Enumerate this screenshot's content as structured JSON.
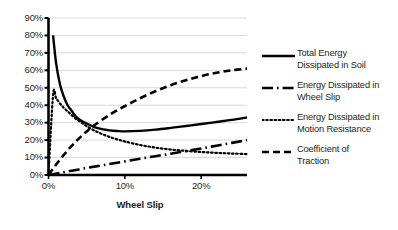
{
  "chart_data": {
    "type": "line",
    "title": "",
    "xlabel": "Wheel Slip",
    "ylabel": "",
    "xlim": [
      0,
      26
    ],
    "ylim": [
      0,
      90
    ],
    "grid": true,
    "legend_position": "right",
    "x_ticks": [
      "0%",
      "10%",
      "20%"
    ],
    "x_tick_values": [
      0,
      10,
      20
    ],
    "y_ticks": [
      "0%",
      "10%",
      "20%",
      "30%",
      "40%",
      "50%",
      "60%",
      "70%",
      "80%",
      "90%"
    ],
    "y_tick_values": [
      0,
      10,
      20,
      30,
      40,
      50,
      60,
      70,
      80,
      90
    ],
    "series": [
      {
        "name": "Total Energy Dissipated in Soil",
        "style": "solid",
        "x": [
          0.6,
          1.0,
          1.5,
          2.0,
          2.5,
          3.0,
          3.5,
          4.0,
          5.0,
          6.0,
          7.0,
          8.0,
          9.0,
          10.0,
          12.0,
          14.0,
          16.0,
          18.0,
          20.0,
          22.0,
          24.0,
          26.0
        ],
        "values": [
          80,
          64,
          52,
          45,
          40,
          37,
          34,
          32,
          29.5,
          27.5,
          26.3,
          25.6,
          25.2,
          25.0,
          25.3,
          26.0,
          27.0,
          28.1,
          29.2,
          30.4,
          31.6,
          33.0
        ]
      },
      {
        "name": "Energy Dissipated in Wheel Slip",
        "style": "dash-dot",
        "x": [
          0,
          2,
          4,
          6,
          8,
          10,
          12,
          14,
          16,
          18,
          20,
          22,
          24,
          26
        ],
        "values": [
          0,
          1.6,
          3.2,
          4.8,
          6.3,
          7.8,
          9.3,
          10.8,
          12.2,
          13.7,
          15.2,
          16.8,
          18.4,
          20.0
        ]
      },
      {
        "name": "Energy Dissipated in Motion Resistance",
        "style": "dotted",
        "x": [
          0,
          0.6,
          1.0,
          1.5,
          2.0,
          2.5,
          3.0,
          3.5,
          4.0,
          4.5,
          5.0,
          6.0,
          7.0,
          8.0,
          9.0,
          10.0,
          12.0,
          14.0,
          16.0,
          18.0,
          20.0,
          22.0,
          24.0,
          26.0
        ],
        "values": [
          0,
          46,
          44,
          41,
          38.5,
          36.5,
          34.5,
          32.5,
          31,
          29.5,
          28,
          25.5,
          23.5,
          21.8,
          20.4,
          19.2,
          17.2,
          15.7,
          14.6,
          13.8,
          13.2,
          12.7,
          12.3,
          12.0
        ]
      },
      {
        "name": "Coefficient of Traction",
        "style": "dashed",
        "x": [
          0,
          1,
          2,
          3,
          4,
          5,
          6,
          8,
          10,
          12,
          14,
          16,
          18,
          20,
          22,
          24,
          26
        ],
        "values": [
          0,
          6,
          11.5,
          16.5,
          21,
          25,
          28.5,
          34.5,
          39.5,
          44,
          48,
          51.5,
          54.3,
          56.7,
          58.6,
          60.0,
          61.0
        ]
      }
    ]
  },
  "axis": {
    "x_title": "Wheel Slip"
  },
  "legend": {
    "entries": [
      {
        "label_line1": "Total Energy",
        "label_line2": "Dissipated in Soil",
        "style": "solid"
      },
      {
        "label_line1": "Energy Dissipated in",
        "label_line2": "Wheel Slip",
        "style": "dash-dot"
      },
      {
        "label_line1": "Energy Dissipated in",
        "label_line2": "Motion Resistance",
        "style": "dotted"
      },
      {
        "label_line1": "Coefficient of",
        "label_line2": "Traction",
        "style": "dashed"
      }
    ]
  },
  "colors": {
    "ink": "#231f20",
    "grid": "#d9d9d9",
    "axis": "#000000",
    "background": "#ffffff"
  }
}
